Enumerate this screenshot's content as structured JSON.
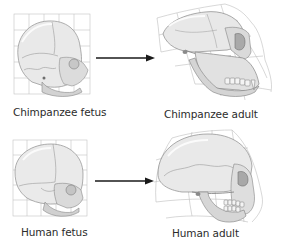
{
  "figure": {
    "type": "skull-shape-transformation-diagram",
    "rows": [
      {
        "name": "chimpanzee",
        "fetus_label": "Chimpanzee fetus",
        "adult_label": "Chimpanzee adult",
        "arrow": "right-arrow"
      },
      {
        "name": "human",
        "fetus_label": "Human fetus",
        "adult_label": "Human adult",
        "arrow": "right-arrow"
      }
    ],
    "colors": {
      "background": "#ffffff",
      "grid_line": "#b8b8b8",
      "skull_light": "#ececec",
      "skull_mid": "#c9c9c9",
      "skull_dark": "#8a8a8a",
      "arrow": "#1a1a1a",
      "label_text": "#2b2b2b"
    }
  }
}
